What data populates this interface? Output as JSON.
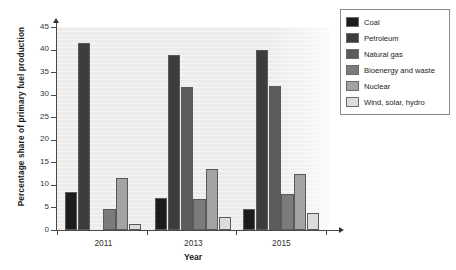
{
  "chart_data": {
    "type": "bar",
    "title": "",
    "xlabel": "Year",
    "ylabel": "Percentage share of primary fuel production",
    "categories": [
      "2011",
      "2013",
      "2015"
    ],
    "ylim": [
      0,
      45
    ],
    "yticks": [
      0,
      5,
      10,
      15,
      20,
      25,
      30,
      35,
      40,
      45
    ],
    "grid": true,
    "legend_position": "right",
    "series": [
      {
        "name": "Coal",
        "color": "#1c1c1c",
        "values": [
          8.4,
          7.0,
          4.6
        ]
      },
      {
        "name": "Petroleum",
        "color": "#3d3d3d",
        "values": [
          41.5,
          38.8,
          40.0
        ]
      },
      {
        "name": "Natural gas",
        "color": "#5c5c5c",
        "values": [
          0,
          31.7,
          32.0
        ]
      },
      {
        "name": "Bioenergy and waste",
        "color": "#7b7b7b",
        "values": [
          4.7,
          6.9,
          8.0
        ]
      },
      {
        "name": "Nuclear",
        "color": "#a3a3a3",
        "values": [
          11.5,
          13.5,
          12.5
        ]
      },
      {
        "name": "Wind, solar, hydro",
        "color": "#dcdcdc",
        "values": [
          1.4,
          2.8,
          3.8
        ]
      }
    ]
  },
  "axis": {
    "y_title": "Percentage share of primary fuel production",
    "x_title": "Year",
    "y_tick_labels": [
      "45",
      "40",
      "35",
      "30",
      "25",
      "20",
      "15",
      "10",
      "5",
      "0"
    ],
    "x_tick_labels": [
      "2011",
      "2013",
      "2015"
    ]
  },
  "legend": {
    "items": [
      {
        "label": "Coal"
      },
      {
        "label": "Petroleum"
      },
      {
        "label": "Natural gas"
      },
      {
        "label": "Bioenergy and waste"
      },
      {
        "label": "Nuclear"
      },
      {
        "label": "Wind, solar, hydro"
      }
    ]
  }
}
